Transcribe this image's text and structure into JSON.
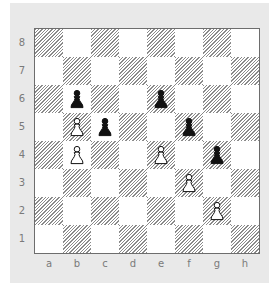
{
  "diagram": {
    "type": "chess-position",
    "ranks": [
      "8",
      "7",
      "6",
      "5",
      "4",
      "3",
      "2",
      "1"
    ],
    "files": [
      "a",
      "b",
      "c",
      "d",
      "e",
      "f",
      "g",
      "h"
    ],
    "colors": {
      "panel_background": "#e9e9e9",
      "light_square": "#ffffff",
      "dark_square_hatch": "#8a8a8a",
      "label_text": "#7a7a7a",
      "border": "#6d6d6d"
    },
    "pieces": [
      {
        "square": "b6",
        "color": "black",
        "type": "pawn"
      },
      {
        "square": "e6",
        "color": "black",
        "type": "pawn"
      },
      {
        "square": "b5",
        "color": "white",
        "type": "pawn"
      },
      {
        "square": "c5",
        "color": "black",
        "type": "pawn"
      },
      {
        "square": "f5",
        "color": "black",
        "type": "pawn"
      },
      {
        "square": "b4",
        "color": "white",
        "type": "pawn"
      },
      {
        "square": "e4",
        "color": "white",
        "type": "pawn"
      },
      {
        "square": "g4",
        "color": "black",
        "type": "pawn"
      },
      {
        "square": "f3",
        "color": "white",
        "type": "pawn"
      },
      {
        "square": "g2",
        "color": "white",
        "type": "pawn"
      }
    ]
  }
}
